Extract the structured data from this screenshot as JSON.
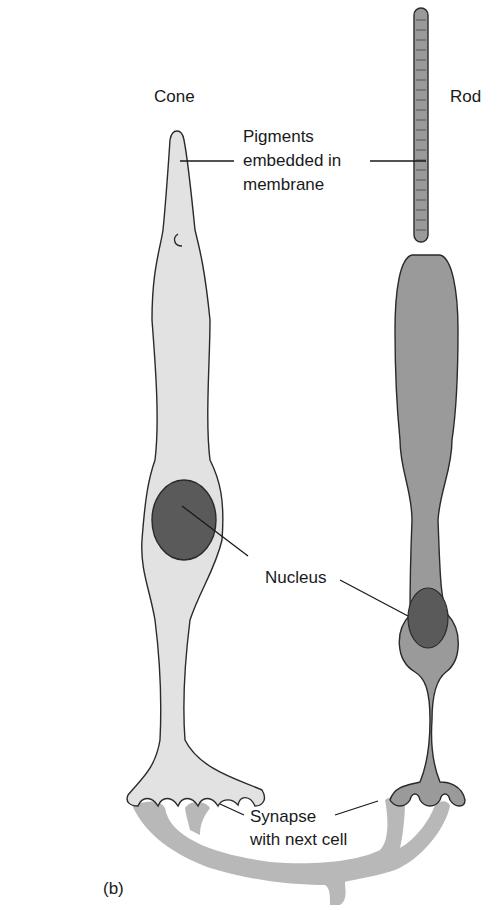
{
  "figure": {
    "panel_label": "(b)",
    "cells": [
      {
        "name": "Cone"
      },
      {
        "name": "Rod"
      }
    ],
    "labels": {
      "pigments_line1": "Pigments",
      "pigments_line2": "embedded in",
      "pigments_line3": "membrane",
      "nucleus": "Nucleus",
      "synapse_line1": "Synapse",
      "synapse_line2": "with next cell"
    },
    "colors": {
      "cone_fill": "#e2e2e2",
      "rod_fill": "#9a9a9a",
      "nucleus_fill": "#5a5a5a",
      "next_cell_fill": "#b8b8b8",
      "outline": "#2a2a2a"
    }
  }
}
